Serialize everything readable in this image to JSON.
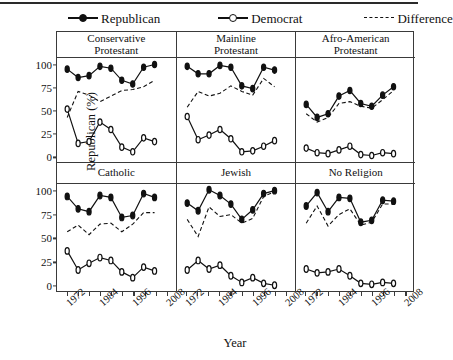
{
  "legend": {
    "items": [
      {
        "label": "Republican",
        "key": "filled-circle-line",
        "id": "republican"
      },
      {
        "label": "Democrat",
        "key": "open-circle-line",
        "id": "democrat"
      },
      {
        "label": "Difference",
        "key": "dashed-line",
        "id": "difference"
      }
    ]
  },
  "axes": {
    "ylabel": "Republican (%)",
    "xlabel": "Year",
    "yticks": [
      0,
      25,
      50,
      75,
      100
    ],
    "xticks": [
      1972,
      1984,
      1996,
      2008
    ]
  },
  "colors": {
    "line": "#111111",
    "frame": "#3a3a3a",
    "background": "#ffffff",
    "open_marker_fill": "#ffffff"
  },
  "chart_data": {
    "type": "line",
    "title": "",
    "xlabel": "Year",
    "ylabel": "Republican (%)",
    "xlim": [
      1970,
      2010
    ],
    "ylim": [
      -5,
      107
    ],
    "grid": false,
    "legend_position": "top",
    "x": [
      1972,
      1976,
      1980,
      1984,
      1988,
      1992,
      1996,
      2000,
      2004,
      2008
    ],
    "panels": [
      {
        "name": "Conservative Protestant",
        "title_lines": [
          "Conservative",
          "Protestant"
        ],
        "row": 0,
        "col": 0,
        "series": [
          {
            "name": "Republican",
            "style": "filled-circle",
            "values": [
              95,
              86,
              88,
              98,
              96,
              83,
              79,
              97,
              100
            ]
          },
          {
            "name": "Democrat",
            "style": "open-circle",
            "values": [
              52,
              15,
              17,
              38,
              30,
              11,
              6,
              21,
              17
            ]
          },
          {
            "name": "Difference",
            "style": "dashed",
            "values": [
              43,
              71,
              67,
              60,
              66,
              72,
              73,
              76,
              83
            ]
          }
        ]
      },
      {
        "name": "Mainline Protestant",
        "title_lines": [
          "Mainline",
          "Protestant"
        ],
        "row": 0,
        "col": 1,
        "series": [
          {
            "name": "Republican",
            "style": "filled-circle",
            "values": [
              98,
              90,
              90,
              99,
              97,
              77,
              74,
              97,
              94
            ]
          },
          {
            "name": "Democrat",
            "style": "open-circle",
            "values": [
              44,
              19,
              24,
              30,
              20,
              6,
              7,
              12,
              18
            ]
          },
          {
            "name": "Difference",
            "style": "dashed",
            "values": [
              54,
              71,
              66,
              69,
              77,
              71,
              67,
              85,
              76
            ]
          }
        ]
      },
      {
        "name": "Afro-American Protestant",
        "title_lines": [
          "Afro-American",
          "Protestant"
        ],
        "row": 0,
        "col": 2,
        "series": [
          {
            "name": "Republican",
            "style": "filled-circle",
            "values": [
              57,
              43,
              47,
              66,
              72,
              58,
              55,
              67,
              76
            ]
          },
          {
            "name": "Democrat",
            "style": "open-circle",
            "values": [
              10,
              5,
              4,
              8,
              12,
              3,
              2,
              5,
              4
            ]
          },
          {
            "name": "Difference",
            "style": "dashed",
            "values": [
              47,
              38,
              43,
              58,
              60,
              55,
              53,
              62,
              72
            ]
          }
        ]
      },
      {
        "name": "Catholic",
        "title_lines": [
          "Catholic"
        ],
        "row": 1,
        "col": 0,
        "series": [
          {
            "name": "Republican",
            "style": "filled-circle",
            "values": [
              94,
              81,
              78,
              95,
              93,
              72,
              74,
              97,
              93
            ]
          },
          {
            "name": "Democrat",
            "style": "open-circle",
            "values": [
              37,
              17,
              24,
              30,
              27,
              15,
              9,
              20,
              16
            ]
          },
          {
            "name": "Difference",
            "style": "dashed",
            "values": [
              57,
              64,
              54,
              65,
              66,
              57,
              65,
              77,
              77
            ]
          }
        ]
      },
      {
        "name": "Jewish",
        "title_lines": [
          "Jewish"
        ],
        "row": 1,
        "col": 1,
        "series": [
          {
            "name": "Republican",
            "style": "filled-circle",
            "values": [
              87,
              79,
              101,
              95,
              86,
              70,
              80,
              97,
              100
            ]
          },
          {
            "name": "Democrat",
            "style": "open-circle",
            "values": [
              17,
              27,
              18,
              22,
              11,
              4,
              9,
              3,
              1
            ]
          },
          {
            "name": "Difference",
            "style": "dashed",
            "values": [
              70,
              52,
              83,
              73,
              75,
              66,
              71,
              94,
              99
            ]
          }
        ]
      },
      {
        "name": "No Religion",
        "title_lines": [
          "No Religion"
        ],
        "row": 1,
        "col": 2,
        "series": [
          {
            "name": "Republican",
            "style": "filled-circle",
            "values": [
              84,
              98,
              78,
              93,
              92,
              67,
              69,
              90,
              89
            ]
          },
          {
            "name": "Democrat",
            "style": "open-circle",
            "values": [
              18,
              14,
              15,
              18,
              11,
              3,
              2,
              4,
              3
            ]
          },
          {
            "name": "Difference",
            "style": "dashed",
            "values": [
              66,
              84,
              63,
              75,
              81,
              64,
              67,
              86,
              86
            ]
          }
        ]
      }
    ]
  }
}
